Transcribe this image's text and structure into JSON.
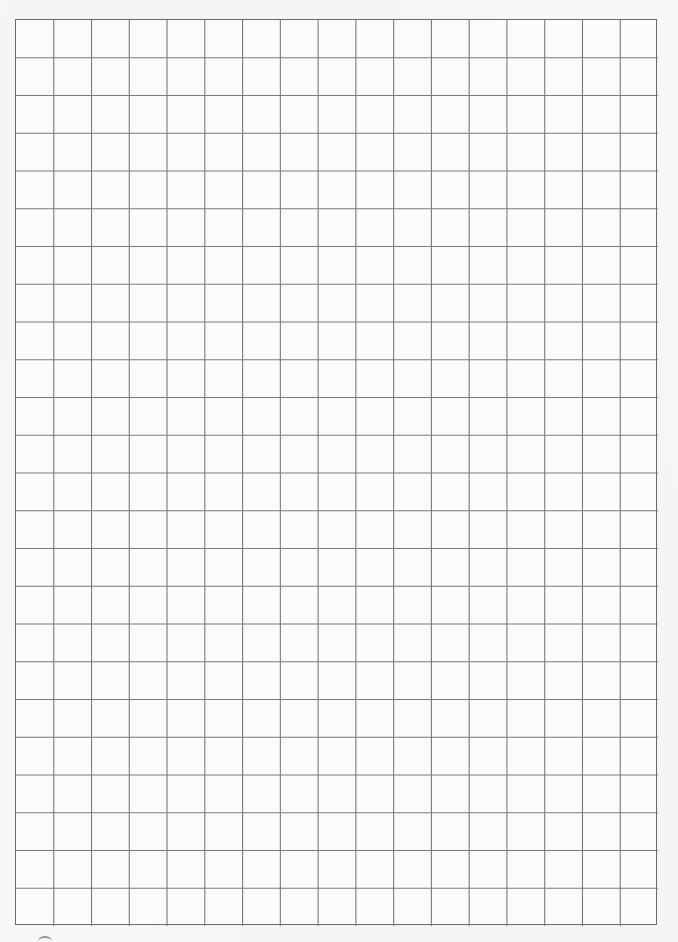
{
  "page": {
    "type": "graph-paper",
    "background_color": "#f7f7f6",
    "grid": {
      "columns": 17,
      "rows": 24,
      "line_color": "#7a7a7a",
      "border_color": "#6a6a6a"
    }
  }
}
